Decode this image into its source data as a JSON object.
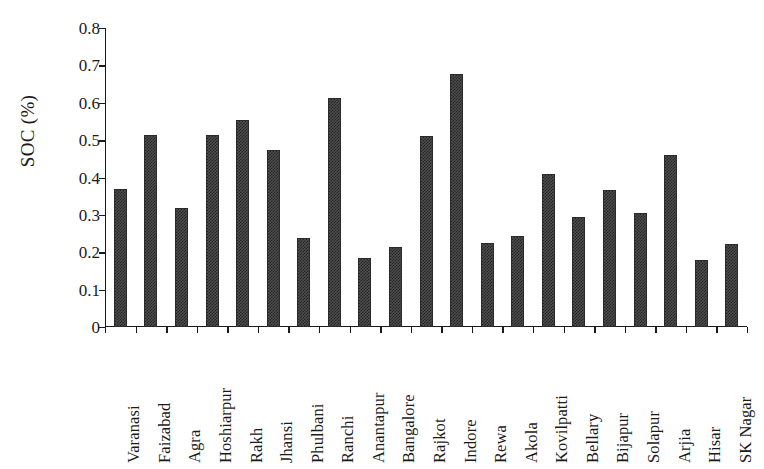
{
  "chart": {
    "title": "",
    "axis_color": "#1a1a1a",
    "bar_color": "#4f4f4f",
    "background": "#ffffff"
  },
  "chart_data": {
    "type": "bar",
    "title": "",
    "subtitle": "",
    "xlabel": "",
    "ylabel": "SOC (%)",
    "ylim": [
      0,
      0.8
    ],
    "ytick_labels": [
      "0",
      "0.1",
      "0.2",
      "0.3",
      "0.4",
      "0.5",
      "0.6",
      "0.7",
      "0.8"
    ],
    "ytick_values": [
      0,
      0.1,
      0.2,
      0.3,
      0.4,
      0.5,
      0.6,
      0.7,
      0.8
    ],
    "grid": false,
    "legend": false,
    "legend_position": "none",
    "categories": [
      "Varanasi",
      "Faizabad",
      "Agra",
      "Hoshiarpur",
      "Rakh",
      "Jhansi",
      "Phulbani",
      "Ranchi",
      "Anantapur",
      "Bangalore",
      "Rajkot",
      "Indore",
      "Rewa",
      "Akola",
      "Kovilpatti",
      "Bellary",
      "Bijapur",
      "Solapur",
      "Arjia",
      "Hisar",
      "SK Nagar"
    ],
    "values": [
      0.368,
      0.514,
      0.319,
      0.514,
      0.555,
      0.473,
      0.237,
      0.613,
      0.185,
      0.215,
      0.511,
      0.676,
      0.225,
      0.243,
      0.41,
      0.295,
      0.366,
      0.305,
      0.46,
      0.18,
      0.222
    ]
  }
}
